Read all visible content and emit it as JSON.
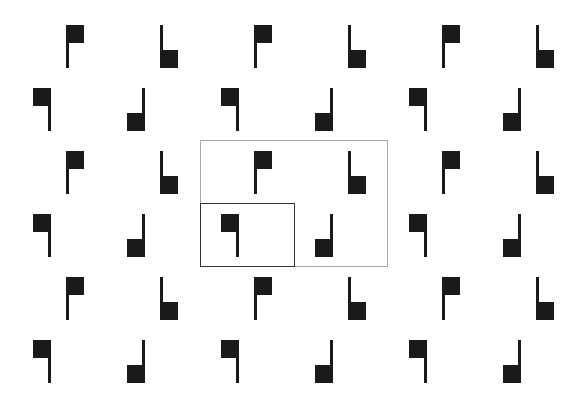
{
  "figure": {
    "background": "#ffffff",
    "glyph_color": "#1a1a1a",
    "glyph_types": {
      "A": "flag-square-top-left-stem-left",
      "B": "stem-left-square-bottom",
      "C": "flag-square-top-left-stem-right",
      "D": "stem-right-square-bottom"
    },
    "rows": [
      {
        "y": 25,
        "glyphs": [
          {
            "type": "A",
            "x": 66
          },
          {
            "type": "B",
            "x": 160
          },
          {
            "type": "A",
            "x": 254
          },
          {
            "type": "B",
            "x": 348
          },
          {
            "type": "A",
            "x": 442
          },
          {
            "type": "B",
            "x": 536
          }
        ]
      },
      {
        "y": 88,
        "glyphs": [
          {
            "type": "C",
            "x": 33
          },
          {
            "type": "D",
            "x": 127
          },
          {
            "type": "C",
            "x": 221
          },
          {
            "type": "D",
            "x": 315
          },
          {
            "type": "C",
            "x": 409
          },
          {
            "type": "D",
            "x": 503
          }
        ]
      },
      {
        "y": 151,
        "glyphs": [
          {
            "type": "A",
            "x": 66
          },
          {
            "type": "B",
            "x": 160
          },
          {
            "type": "A",
            "x": 254
          },
          {
            "type": "B",
            "x": 348
          },
          {
            "type": "A",
            "x": 442
          },
          {
            "type": "B",
            "x": 536
          }
        ]
      },
      {
        "y": 214,
        "glyphs": [
          {
            "type": "C",
            "x": 33
          },
          {
            "type": "D",
            "x": 127
          },
          {
            "type": "C",
            "x": 221
          },
          {
            "type": "D",
            "x": 315
          },
          {
            "type": "C",
            "x": 409
          },
          {
            "type": "D",
            "x": 503
          }
        ]
      },
      {
        "y": 277,
        "glyphs": [
          {
            "type": "A",
            "x": 66
          },
          {
            "type": "B",
            "x": 160
          },
          {
            "type": "A",
            "x": 254
          },
          {
            "type": "B",
            "x": 348
          },
          {
            "type": "A",
            "x": 442
          },
          {
            "type": "B",
            "x": 536
          }
        ]
      },
      {
        "y": 340,
        "glyphs": [
          {
            "type": "C",
            "x": 33
          },
          {
            "type": "D",
            "x": 127
          },
          {
            "type": "C",
            "x": 221
          },
          {
            "type": "D",
            "x": 315
          },
          {
            "type": "C",
            "x": 409
          },
          {
            "type": "D",
            "x": 503
          }
        ]
      }
    ],
    "frames": [
      {
        "name": "outer-unit-cell-frame",
        "x": 200,
        "y": 140,
        "width": 188,
        "height": 127,
        "color": "#a8a8a8",
        "thickness": 1
      },
      {
        "name": "inner-unit-cell-frame",
        "x": 200,
        "y": 203,
        "width": 95,
        "height": 64,
        "color": "#333333",
        "thickness": 1.5
      }
    ]
  }
}
